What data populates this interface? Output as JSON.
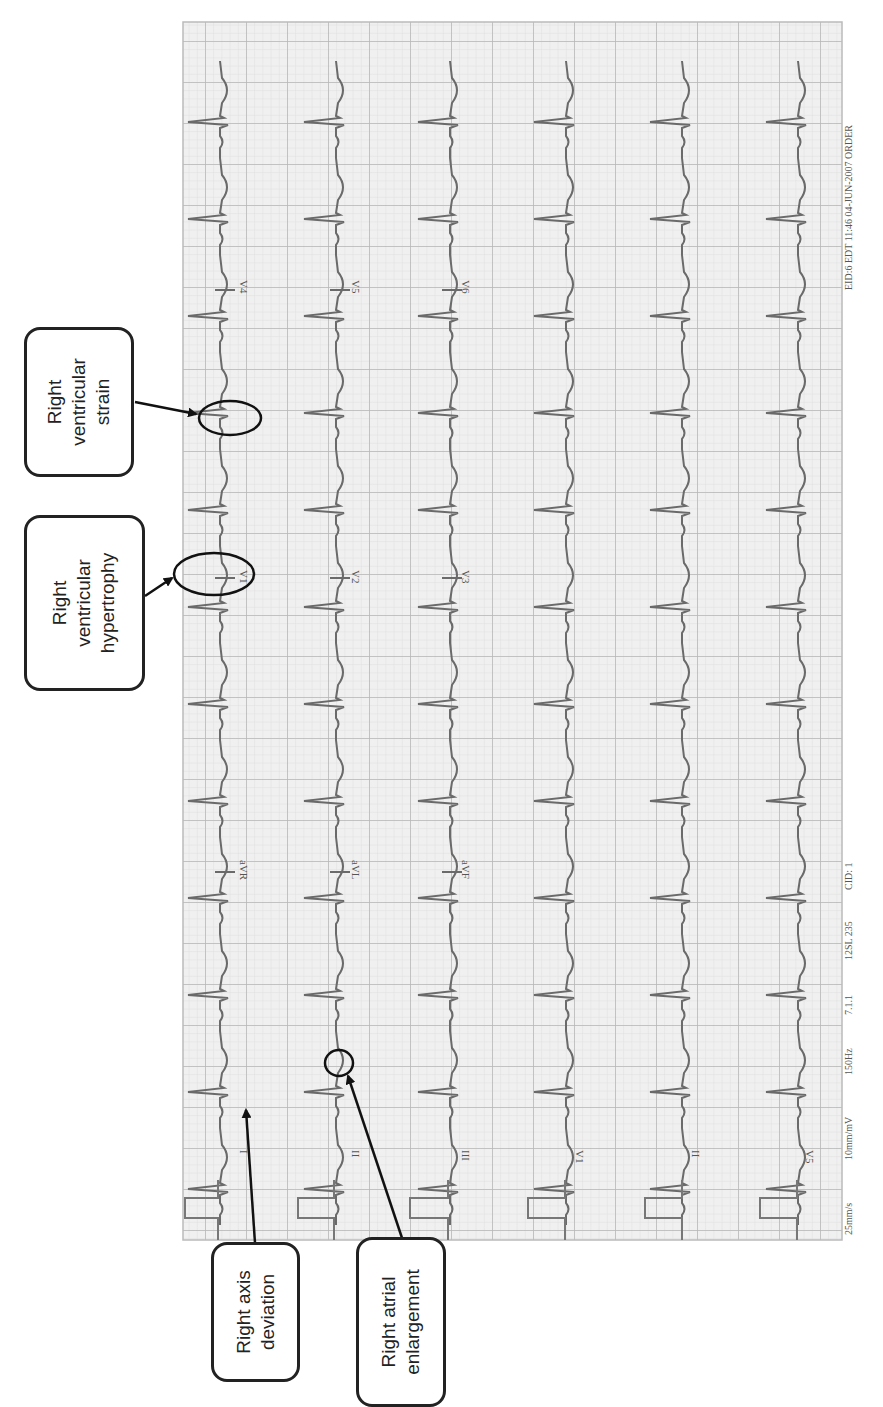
{
  "figure": {
    "orientation": "rotated 90deg clockwise",
    "ecg": {
      "grid": {
        "x": 183,
        "y": 22,
        "width": 659,
        "height": 1218,
        "minor_color": "#d9d9d9",
        "major_color": "#b3b3b3",
        "background": "#f2f2f2"
      },
      "trace_color": "#6e6e6e",
      "footer_text": {
        "speed": "25mm/s",
        "gain": "10mm/mV",
        "filter": "150Hz",
        "version": "7.1.1",
        "misc": "12SL 235",
        "cid": "CID: 1",
        "device": "EID:6 EDT 11:46 04-JUN-2007 ORDER"
      },
      "rows": [
        {
          "leads": [
            "I",
            "aVR",
            "V1",
            "V4"
          ]
        },
        {
          "leads": [
            "II",
            "aVL",
            "V2",
            "V5"
          ]
        },
        {
          "leads": [
            "III",
            "aVF",
            "V3",
            "V6"
          ]
        },
        {
          "leads": [
            "V1"
          ]
        },
        {
          "leads": [
            "II"
          ]
        },
        {
          "leads": [
            "V5"
          ]
        }
      ]
    },
    "callouts": [
      {
        "id": "rv-strain",
        "lines": [
          "Right",
          "ventricular",
          "strain"
        ]
      },
      {
        "id": "rvh",
        "lines": [
          "Right",
          "ventricular",
          "hypertrophy"
        ]
      },
      {
        "id": "rad",
        "lines": [
          "Right axis",
          "deviation"
        ]
      },
      {
        "id": "rae",
        "lines": [
          "Right atrial",
          "enlargement"
        ]
      }
    ]
  }
}
